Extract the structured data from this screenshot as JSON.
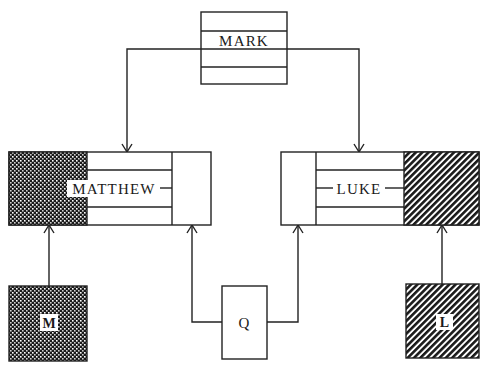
{
  "diagram": {
    "title": "",
    "nodes": {
      "mark": {
        "label": "MARK",
        "fill": "none"
      },
      "matthew": {
        "label": "MATTHEW",
        "fill": "dotted"
      },
      "luke": {
        "label": "LUKE",
        "fill": "hatched"
      },
      "m": {
        "label": "M",
        "fill": "dotted"
      },
      "q": {
        "label": "Q",
        "fill": "none"
      },
      "l": {
        "label": "L",
        "fill": "hatched"
      }
    },
    "edges": [
      {
        "from": "MARK",
        "to": "MATTHEW"
      },
      {
        "from": "MARK",
        "to": "LUKE"
      },
      {
        "from": "M",
        "to": "MATTHEW"
      },
      {
        "from": "Q",
        "to": "MATTHEW"
      },
      {
        "from": "Q",
        "to": "LUKE"
      },
      {
        "from": "L",
        "to": "LUKE"
      }
    ],
    "colors": {
      "stroke": "#222222",
      "background": "#ffffff",
      "pattern_dark": "#1a1a1a"
    }
  }
}
